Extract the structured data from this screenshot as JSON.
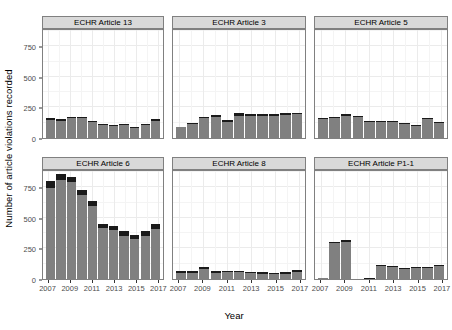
{
  "chart_data": {
    "type": "bar",
    "subtype": "stacked-bar-faceted",
    "title": "",
    "xlabel": "Year",
    "ylabel": "Number of article violations recorded",
    "x": [
      2007,
      2008,
      2009,
      2010,
      2011,
      2012,
      2013,
      2014,
      2015,
      2016,
      2017
    ],
    "xtick_labels": [
      "2007",
      "2009",
      "2011",
      "2013",
      "2015",
      "2017"
    ],
    "xtick_values": [
      2007,
      2009,
      2011,
      2013,
      2015,
      2017
    ],
    "ylim": [
      0,
      900
    ],
    "ytick_labels": [
      "0",
      "250",
      "500",
      "750"
    ],
    "ytick_values": [
      0,
      250,
      500,
      750
    ],
    "grid": true,
    "legend": "none",
    "facet_layout": {
      "rows": 2,
      "cols": 3
    },
    "series": [
      {
        "name": "lower-segment",
        "color": "#808080"
      },
      {
        "name": "upper-segment",
        "color": "#1a1a1a"
      }
    ],
    "panels": [
      {
        "label": "ECHR Article 13",
        "categories": [
          2007,
          2008,
          2009,
          2010,
          2011,
          2012,
          2013,
          2014,
          2015,
          2016,
          2017
        ],
        "lower": [
          150,
          143,
          163,
          164,
          130,
          104,
          100,
          106,
          86,
          108,
          143
        ],
        "upper": [
          12,
          9,
          11,
          12,
          9,
          7,
          7,
          8,
          7,
          8,
          11
        ],
        "totals": [
          162,
          152,
          174,
          176,
          139,
          111,
          107,
          114,
          93,
          116,
          154
        ]
      },
      {
        "label": "ECHR Article 3",
        "categories": [
          2007,
          2008,
          2009,
          2010,
          2011,
          2012,
          2013,
          2014,
          2015,
          2016,
          2017
        ],
        "lower": [
          87,
          113,
          163,
          176,
          133,
          184,
          179,
          182,
          179,
          192,
          193
        ],
        "upper": [
          6,
          8,
          13,
          16,
          11,
          24,
          16,
          15,
          16,
          16,
          14
        ],
        "totals": [
          93,
          121,
          176,
          192,
          144,
          208,
          195,
          197,
          195,
          208,
          207
        ]
      },
      {
        "label": "ECHR Article 5",
        "categories": [
          2007,
          2008,
          2009,
          2010,
          2011,
          2012,
          2013,
          2014,
          2015,
          2016,
          2017
        ],
        "lower": [
          158,
          163,
          184,
          169,
          131,
          131,
          129,
          112,
          100,
          156,
          124
        ],
        "upper": [
          9,
          11,
          13,
          11,
          9,
          9,
          9,
          8,
          7,
          11,
          9
        ],
        "totals": [
          167,
          174,
          197,
          180,
          140,
          140,
          138,
          120,
          107,
          167,
          133
        ]
      },
      {
        "label": "ECHR Article 6",
        "categories": [
          2007,
          2008,
          2009,
          2010,
          2011,
          2012,
          2013,
          2014,
          2015,
          2016,
          2017
        ],
        "lower": [
          747,
          812,
          790,
          685,
          594,
          414,
          397,
          355,
          327,
          352,
          411
        ],
        "upper": [
          56,
          47,
          45,
          44,
          41,
          40,
          38,
          37,
          36,
          38,
          41
        ],
        "totals": [
          803,
          859,
          835,
          729,
          635,
          454,
          435,
          392,
          363,
          390,
          452
        ]
      },
      {
        "label": "ECHR Article 8",
        "categories": [
          2007,
          2008,
          2009,
          2010,
          2011,
          2012,
          2013,
          2014,
          2015,
          2016,
          2017
        ],
        "lower": [
          52,
          51,
          79,
          51,
          54,
          54,
          48,
          44,
          40,
          45,
          55
        ],
        "upper": [
          13,
          13,
          19,
          13,
          13,
          14,
          12,
          11,
          11,
          12,
          15
        ],
        "totals": [
          65,
          64,
          98,
          64,
          67,
          68,
          60,
          55,
          51,
          57,
          70
        ]
      },
      {
        "label": "ECHR Article P1-1",
        "categories": [
          2007,
          2008,
          2009,
          2010,
          2011,
          2012,
          2013,
          2014,
          2015,
          2016,
          2017
        ],
        "lower": [
          5,
          296,
          306,
          3,
          4,
          106,
          98,
          86,
          87,
          87,
          108
        ],
        "upper": [
          1,
          8,
          12,
          1,
          1,
          10,
          8,
          8,
          8,
          8,
          10
        ],
        "totals": [
          6,
          304,
          318,
          4,
          5,
          116,
          106,
          94,
          95,
          95,
          118
        ]
      }
    ]
  },
  "axes": {
    "y_title": "Number of article violations recorded",
    "x_title": "Year"
  },
  "style": {
    "bar_lower_color": "#808080",
    "bar_upper_color": "#1a1a1a",
    "panel_background": "#ffffff",
    "strip_background": "#d9d9d9",
    "gridline_color": "#ebebeb",
    "border_color": "#808080",
    "tick_label_color": "#4d4d4d"
  }
}
